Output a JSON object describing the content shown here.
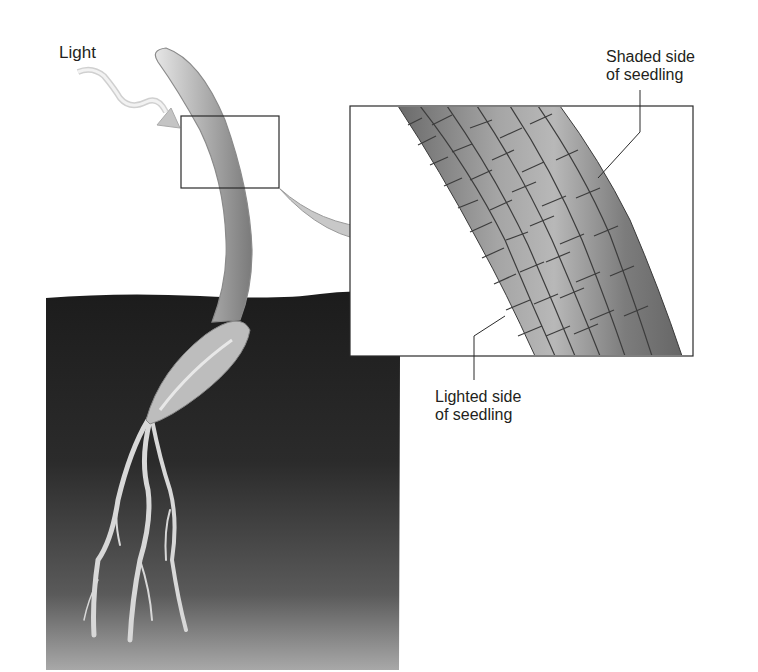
{
  "figure": {
    "topic": "Phototropism in a seedling",
    "labels": {
      "light": "Light",
      "shaded_line1": "Shaded side",
      "shaded_line2": "of seedling",
      "lighted_line1": "Lighted side",
      "lighted_line2": "of seedling"
    },
    "colors": {
      "soil_dark": "#1e1e1e",
      "soil_light": "#9a9a9a",
      "stem": "#b8b8b8",
      "cell_dark": "#6f6f6f",
      "cell_light": "#b5b5b5",
      "outline": "#2a2a2a",
      "arrow_fill": "#c8c8c8"
    }
  }
}
